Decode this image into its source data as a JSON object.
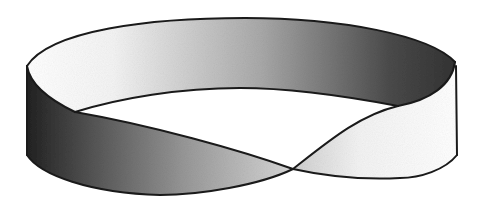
{
  "figure": {
    "colors": {
      "background": "#ffffff",
      "outline": "#1a1a1a",
      "shade_dark": "#2a2a2a",
      "shade_mid": "#8a8a8a",
      "shade_light": "#ffffff"
    }
  }
}
